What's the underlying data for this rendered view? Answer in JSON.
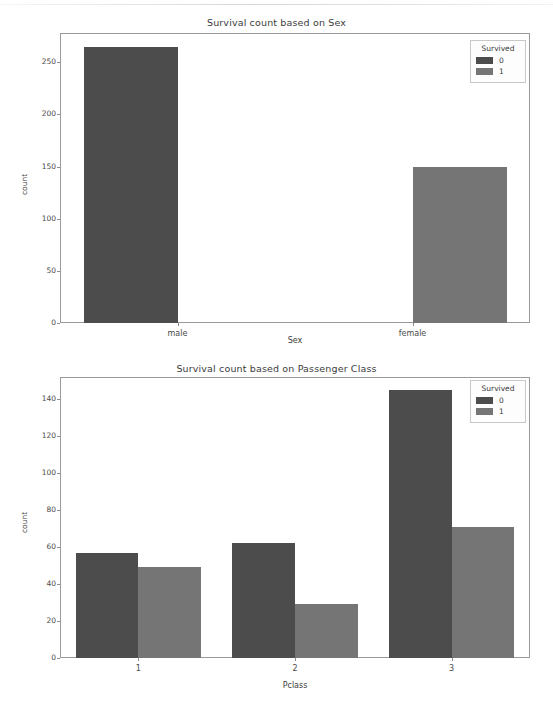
{
  "page": {
    "background": "#ffffff",
    "bottom_ghost_text": ""
  },
  "palette": {
    "bar_dark": "#4c4c4c",
    "bar_light": "#757575",
    "axis": "#9a9a9a",
    "text": "#3b3b3b",
    "tick_text": "#4a4a4a"
  },
  "chart_data": [
    {
      "id": "survival-by-sex",
      "type": "bar",
      "title": "Survival count based on Sex",
      "xlabel": "Sex",
      "ylabel": "count",
      "categories": [
        "male",
        "female"
      ],
      "yticks": [
        0,
        50,
        100,
        150,
        200,
        250
      ],
      "ylim": [
        0,
        278
      ],
      "grid": false,
      "legend": {
        "title": "Survived",
        "position": "upper right",
        "entries": [
          {
            "label": "0",
            "color": "#4c4c4c"
          },
          {
            "label": "1",
            "color": "#757575"
          }
        ]
      },
      "series": [
        {
          "name": "0",
          "color": "#4c4c4c",
          "values": [
            265,
            null
          ]
        },
        {
          "name": "1",
          "color": "#757575",
          "values": [
            null,
            150
          ]
        }
      ]
    },
    {
      "id": "survival-by-passenger-class",
      "type": "bar",
      "title": "Survival count based on Passenger Class",
      "xlabel": "Pclass",
      "ylabel": "count",
      "categories": [
        "1",
        "2",
        "3"
      ],
      "yticks": [
        0,
        20,
        40,
        60,
        80,
        100,
        120,
        140
      ],
      "ylim": [
        0,
        152
      ],
      "grid": false,
      "legend": {
        "title": "Survived",
        "position": "upper right",
        "entries": [
          {
            "label": "0",
            "color": "#4c4c4c"
          },
          {
            "label": "1",
            "color": "#757575"
          }
        ]
      },
      "series": [
        {
          "name": "0",
          "color": "#4c4c4c",
          "values": [
            57,
            62,
            145
          ]
        },
        {
          "name": "1",
          "color": "#757575",
          "values": [
            49,
            29,
            71
          ]
        }
      ]
    }
  ]
}
